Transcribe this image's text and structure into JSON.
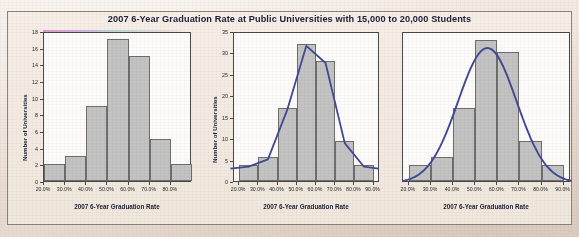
{
  "figure": {
    "title": "2007 6-Year Graduation Rate at Public Universities with 15,000 to 20,000 Students",
    "bar_fill_color": "#c3c3c3",
    "bar_border_color": "#6e6e6e",
    "curve_color": "#3f4a96",
    "panel_background": "#fdfcfb",
    "page_background": "#efe5dc"
  },
  "chart_data": [
    {
      "type": "bar",
      "title": "",
      "xlabel": "2007 6-Year Graduation Rate",
      "ylabel": "Number of Universities",
      "categories": [
        "20.0%",
        "30.0%",
        "40.0%",
        "50.0%",
        "60.0%",
        "70.0%",
        "80.0%"
      ],
      "xticks": [
        "20.0%",
        "30.0%",
        "40.0%",
        "50.0%",
        "60.0%",
        "70.0%",
        "80.0%"
      ],
      "values": [
        2,
        3,
        9,
        17,
        15,
        5,
        2
      ],
      "yticks": [
        0,
        2,
        4,
        6,
        8,
        10,
        12,
        14,
        16,
        18
      ],
      "ylim": [
        0,
        18
      ],
      "grid": false,
      "legend": "none",
      "overlay_curve": false
    },
    {
      "type": "bar",
      "title": "",
      "xlabel": "2007 6-Year Graduation Rate",
      "ylabel": "Number of Universities",
      "categories": [
        "20.0%",
        "30.0%",
        "40.0%",
        "50.0%",
        "60.0%",
        "70.0%",
        "80.0%"
      ],
      "xticks": [
        "20.0%",
        "30.0%",
        "40.0%",
        "50.0%",
        "60.0%",
        "70.0%",
        "80.0%",
        "90.0%"
      ],
      "values": [
        3.8,
        5.5,
        17,
        32,
        28,
        9.3,
        3.8
      ],
      "yticks": [
        0,
        5,
        10,
        15,
        20,
        25,
        30,
        35
      ],
      "ylim": [
        0,
        35
      ],
      "grid": false,
      "legend": "none",
      "overlay_curve": true,
      "curve_type": "polyline-through-bar-midpoints",
      "curve_values": [
        3.8,
        5.5,
        17,
        32,
        28,
        9.3,
        3.8
      ]
    },
    {
      "type": "bar",
      "title": "",
      "xlabel": "2007 6-Year Graduation Rate",
      "ylabel": "",
      "categories": [
        "20.0%",
        "30.0%",
        "40.0%",
        "50.0%",
        "60.0%",
        "70.0%",
        "80.0%"
      ],
      "xticks": [
        "20.0%",
        "30.0%",
        "40.0%",
        "50.0%",
        "60.0%",
        "70.0%",
        "80.0%",
        "90.0%"
      ],
      "values": [
        3.8,
        5.5,
        17,
        33,
        30,
        9.3,
        3.8
      ],
      "yticks": [],
      "ylim": [
        0,
        35
      ],
      "grid": false,
      "legend": "none",
      "overlay_curve": true,
      "curve_type": "smooth-normal-density",
      "curve_peak_value": 31.5,
      "curve_peak_x": "56%"
    }
  ]
}
